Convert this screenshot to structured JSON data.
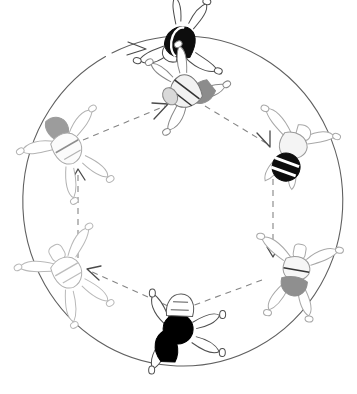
{
  "figure": {
    "type": "diagram",
    "background": "#ffffff",
    "canvas": {
      "width": 357,
      "height": 394
    }
  },
  "outer_ring": {
    "name": "outer-rotation-arrow",
    "shape": "circle",
    "direction": "clockwise",
    "center": {
      "x": 179,
      "y": 210
    },
    "radius_x": 159,
    "radius_y": 165,
    "stroke": "#555555",
    "stroke_width": 1,
    "dashed": false,
    "arrowhead_at_angle_deg": 242
  },
  "inner_path": {
    "name": "inner-transition-cycle",
    "shape": "hexagon",
    "direction": "counterclockwise",
    "stroke": "#7a7a7a",
    "stroke_width": 1.1,
    "dash_pattern": "6 6",
    "segments": [
      {
        "from": "pose-6-upper-left",
        "to": "pose-1-top-center",
        "arrow_at": "to"
      },
      {
        "from": "pose-1-top-center",
        "to": "pose-2-upper-right",
        "arrow_at": "to"
      },
      {
        "from": "pose-2-upper-right",
        "to": "pose-3-lower-right",
        "arrow_at": "to"
      },
      {
        "from": "pose-3-lower-right",
        "to": "pose-4-bottom-center",
        "arrow_at": "to"
      },
      {
        "from": "pose-4-bottom-center",
        "to": "pose-5-lower-left",
        "arrow_at": "to"
      },
      {
        "from": "pose-5-lower-left",
        "to": "pose-6-upper-left",
        "arrow_at": "to"
      }
    ]
  },
  "poses": [
    {
      "id": "pose-1-top-center",
      "label": "top-center figure",
      "position": {
        "x": 180,
        "y": 40
      },
      "rotation_deg": 195,
      "torso_fill": "#0d0d0d",
      "outline": "#333333",
      "shade": "black"
    },
    {
      "id": "pose-6b-upper-center",
      "label": "upper-center figure",
      "position": {
        "x": 185,
        "y": 90
      },
      "rotation_deg": 150,
      "torso_fill": "#8c8c8c",
      "outline": "#777777",
      "shade": "mid-gray"
    },
    {
      "id": "pose-2-upper-right",
      "label": "upper-right figure",
      "position": {
        "x": 292,
        "y": 148
      },
      "rotation_deg": 20,
      "torso_fill": "#0d0d0d",
      "outline": "#9a9a9a",
      "shade": "black"
    },
    {
      "id": "pose-3-lower-right",
      "label": "lower-right figure",
      "position": {
        "x": 296,
        "y": 272
      },
      "rotation_deg": 10,
      "torso_fill": "#909090",
      "outline": "#a0a0a0",
      "shade": "mid-gray"
    },
    {
      "id": "pose-4-bottom-center",
      "label": "bottom-center figure",
      "position": {
        "x": 178,
        "y": 332
      },
      "rotation_deg": 272,
      "torso_fill": "#000000",
      "outline": "#444444",
      "shade": "black"
    },
    {
      "id": "pose-5-lower-left",
      "label": "lower-left figure",
      "position": {
        "x": 68,
        "y": 272
      },
      "rotation_deg": 330,
      "torso_fill": "#ffffff",
      "outline": "#b8b8b8",
      "shade": "white"
    },
    {
      "id": "pose-6-upper-left",
      "label": "upper-left figure",
      "position": {
        "x": 68,
        "y": 148
      },
      "rotation_deg": 330,
      "torso_fill": "#9a9a9a",
      "outline": "#b0b0b0",
      "shade": "light-gray"
    }
  ],
  "colors": {
    "ink_dark": "#0d0d0d",
    "ink_mid": "#8c8c8c",
    "ink_light": "#c4c4c4",
    "ring_stroke": "#555555",
    "dash_stroke": "#7a7a7a"
  }
}
